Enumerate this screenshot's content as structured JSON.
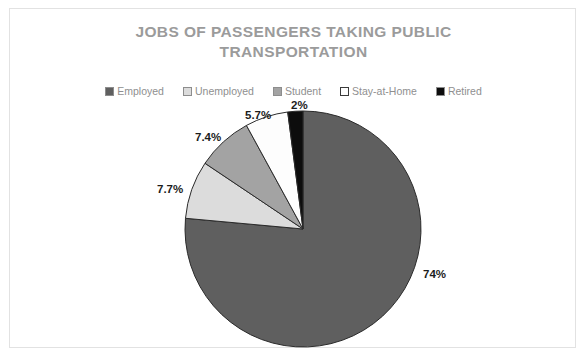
{
  "chart_data": {
    "type": "pie",
    "title": "JOBS OF PASSENGERS TAKING PUBLIC TRANSPORTATION",
    "title_line_1": "JOBS OF PASSENGERS TAKING PUBLIC",
    "title_line_2": "TRANSPORTATION",
    "categories": [
      "Employed",
      "Unemployed",
      "Student",
      "Stay-at-Home",
      "Retired"
    ],
    "values": [
      74,
      7.7,
      7.4,
      5.7,
      2
    ],
    "data_labels": [
      "74%",
      "7.7%",
      "7.4%",
      "5.7%",
      "2%"
    ],
    "colors": [
      "#5f5f5f",
      "#dcdcdc",
      "#a3a3a3",
      "#fdfdfd",
      "#0d0d0d"
    ],
    "legend_position": "top",
    "grid": false,
    "xlabel": "",
    "ylabel": "",
    "start_angle_deg": 0,
    "direction": "clockwise"
  },
  "title": {
    "line1": "JOBS OF PASSENGERS TAKING PUBLIC",
    "line2": "TRANSPORTATION",
    "color": "#9b9b9b"
  },
  "legend": {
    "items": [
      {
        "label": "Employed",
        "color": "#5f5f5f"
      },
      {
        "label": "Unemployed",
        "color": "#dcdcdc"
      },
      {
        "label": "Student",
        "color": "#a3a3a3"
      },
      {
        "label": "Stay-at-Home",
        "color": "#fdfdfd"
      },
      {
        "label": "Retired",
        "color": "#0d0d0d"
      }
    ]
  },
  "labels": {
    "employed": "74%",
    "unemployed": "7.7%",
    "student": "7.4%",
    "stay_at_home": "5.7%",
    "retired": "2%"
  }
}
